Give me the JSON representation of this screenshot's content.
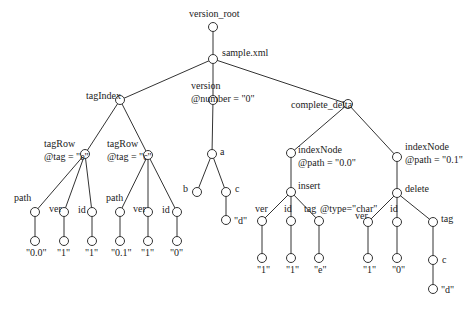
{
  "diagram": {
    "type": "tree",
    "style": {
      "line_color": "#333333",
      "node_fill": "#ffffff",
      "node_stroke": "#333333",
      "node_radius": 4.5
    },
    "nodes": [
      {
        "id": "version_root",
        "x": 213,
        "y": 27,
        "label": "version_root",
        "lx": 189,
        "ly": 8
      },
      {
        "id": "sample_xml",
        "x": 213,
        "y": 59,
        "label": "sample.xml",
        "lx": 222,
        "ly": 47
      },
      {
        "id": "tagIndex",
        "x": 120,
        "y": 100,
        "label": "tagIndex",
        "lx": 86,
        "ly": 90
      },
      {
        "id": "version",
        "x": 213,
        "y": 100,
        "label": "version",
        "label2": "@number = \"0\"",
        "lx": 191,
        "ly": 80
      },
      {
        "id": "complete_delta",
        "x": 348,
        "y": 104,
        "label": "complete_delta",
        "lx": 291,
        "ly": 99
      },
      {
        "id": "tagRow_e",
        "x": 85,
        "y": 154,
        "label": "tagRow",
        "label2": "@tag = \"e\"",
        "lx": 44,
        "ly": 138
      },
      {
        "id": "tagRow_c",
        "x": 148,
        "y": 155,
        "label": "tagRow",
        "label2": "@tag = \"c\"",
        "lx": 107,
        "ly": 138
      },
      {
        "id": "a",
        "x": 212,
        "y": 154,
        "label": "a",
        "lx": 220,
        "ly": 146
      },
      {
        "id": "indexNode_00",
        "x": 291,
        "y": 153,
        "label": "indexNode",
        "label2": "@path = \"0.0\"",
        "lx": 298,
        "ly": 144
      },
      {
        "id": "indexNode_01",
        "x": 397,
        "y": 157,
        "label": "indexNode",
        "label2": "@path = \"0.1\"",
        "lx": 405,
        "ly": 141
      },
      {
        "id": "path1",
        "x": 35,
        "y": 212,
        "label": "path",
        "lx": 14,
        "ly": 192
      },
      {
        "id": "ver1",
        "x": 64,
        "y": 212,
        "label": "ver",
        "lx": 49,
        "ly": 203
      },
      {
        "id": "id1",
        "x": 92,
        "y": 212,
        "label": "id",
        "lx": 78,
        "ly": 204
      },
      {
        "id": "path2",
        "x": 120,
        "y": 212,
        "label": "path",
        "lx": 106,
        "ly": 192
      },
      {
        "id": "ver2",
        "x": 148,
        "y": 212,
        "label": "ver",
        "lx": 133,
        "ly": 203
      },
      {
        "id": "id2",
        "x": 177,
        "y": 212,
        "label": "id",
        "lx": 162,
        "ly": 204
      },
      {
        "id": "b",
        "x": 197,
        "y": 192,
        "label": "b",
        "lx": 183,
        "ly": 183
      },
      {
        "id": "c1",
        "x": 226,
        "y": 192,
        "label": "c",
        "lx": 235,
        "ly": 183
      },
      {
        "id": "insert",
        "x": 291,
        "y": 192,
        "label": "insert",
        "lx": 298,
        "ly": 180
      },
      {
        "id": "delete",
        "x": 397,
        "y": 193,
        "label": "delete",
        "lx": 405,
        "ly": 183
      },
      {
        "id": "v00",
        "x": 35,
        "y": 241,
        "label": "\"0.0\"",
        "lx": 26,
        "ly": 247
      },
      {
        "id": "v1a",
        "x": 64,
        "y": 241,
        "label": "\"1\"",
        "lx": 57,
        "ly": 247
      },
      {
        "id": "v1b",
        "x": 92,
        "y": 241,
        "label": "\"1\"",
        "lx": 85,
        "ly": 247
      },
      {
        "id": "v01",
        "x": 120,
        "y": 241,
        "label": "\"0.1\"",
        "lx": 111,
        "ly": 247
      },
      {
        "id": "v1c",
        "x": 148,
        "y": 241,
        "label": "\"1\"",
        "lx": 141,
        "ly": 247
      },
      {
        "id": "v0a",
        "x": 177,
        "y": 241,
        "label": "\"0\"",
        "lx": 170,
        "ly": 247
      },
      {
        "id": "d1",
        "x": 226,
        "y": 220,
        "label": "\"d\"",
        "lx": 234,
        "ly": 215
      },
      {
        "id": "ver3",
        "x": 262,
        "y": 221,
        "label": "ver",
        "lx": 255,
        "ly": 203
      },
      {
        "id": "id3",
        "x": 291,
        "y": 221,
        "label": "id",
        "lx": 284,
        "ly": 203
      },
      {
        "id": "tag3",
        "x": 319,
        "y": 221,
        "label": "tag",
        "lx": 304,
        "ly": 203
      },
      {
        "id": "ver4",
        "x": 368,
        "y": 222,
        "label": "ver",
        "lx": 355,
        "ly": 210
      },
      {
        "id": "id4",
        "x": 397,
        "y": 222,
        "label": "id",
        "lx": 390,
        "ly": 203
      },
      {
        "id": "tag4",
        "x": 433,
        "y": 222,
        "label": "tag",
        "lx": 441,
        "ly": 213
      },
      {
        "id": "v1d",
        "x": 262,
        "y": 258,
        "label": "\"1\"",
        "lx": 257,
        "ly": 264
      },
      {
        "id": "v1e",
        "x": 291,
        "y": 258,
        "label": "\"1\"",
        "lx": 286,
        "ly": 264
      },
      {
        "id": "ve",
        "x": 319,
        "y": 258,
        "label": "\"e\"",
        "lx": 314,
        "ly": 264
      },
      {
        "id": "v1f",
        "x": 368,
        "y": 258,
        "label": "\"1\"",
        "lx": 363,
        "ly": 264
      },
      {
        "id": "v0b",
        "x": 397,
        "y": 258,
        "label": "\"0\"",
        "lx": 392,
        "ly": 264
      },
      {
        "id": "c2",
        "x": 433,
        "y": 260,
        "label": "c",
        "lx": 442,
        "ly": 254
      },
      {
        "id": "d2",
        "x": 433,
        "y": 289,
        "label": "\"d\"",
        "lx": 441,
        "ly": 284
      }
    ],
    "annotations": [
      {
        "id": "type_char",
        "text": "@type=\"char\"",
        "x": 320,
        "y": 203
      }
    ],
    "edges": [
      [
        "version_root",
        "sample_xml"
      ],
      [
        "sample_xml",
        "tagIndex"
      ],
      [
        "sample_xml",
        "version"
      ],
      [
        "sample_xml",
        "complete_delta"
      ],
      [
        "tagIndex",
        "tagRow_e"
      ],
      [
        "tagIndex",
        "tagRow_c"
      ],
      [
        "tagRow_e",
        "path1"
      ],
      [
        "tagRow_e",
        "ver1"
      ],
      [
        "tagRow_e",
        "id1"
      ],
      [
        "tagRow_c",
        "path2"
      ],
      [
        "tagRow_c",
        "ver2"
      ],
      [
        "tagRow_c",
        "id2"
      ],
      [
        "path1",
        "v00"
      ],
      [
        "ver1",
        "v1a"
      ],
      [
        "id1",
        "v1b"
      ],
      [
        "path2",
        "v01"
      ],
      [
        "ver2",
        "v1c"
      ],
      [
        "id2",
        "v0a"
      ],
      [
        "version",
        "a"
      ],
      [
        "a",
        "b"
      ],
      [
        "a",
        "c1"
      ],
      [
        "c1",
        "d1"
      ],
      [
        "complete_delta",
        "indexNode_00"
      ],
      [
        "complete_delta",
        "indexNode_01"
      ],
      [
        "indexNode_00",
        "insert"
      ],
      [
        "insert",
        "ver3"
      ],
      [
        "insert",
        "id3"
      ],
      [
        "insert",
        "tag3"
      ],
      [
        "ver3",
        "v1d"
      ],
      [
        "id3",
        "v1e"
      ],
      [
        "tag3",
        "ve"
      ],
      [
        "indexNode_01",
        "delete"
      ],
      [
        "delete",
        "ver4"
      ],
      [
        "delete",
        "id4"
      ],
      [
        "delete",
        "tag4"
      ],
      [
        "ver4",
        "v1f"
      ],
      [
        "id4",
        "v0b"
      ],
      [
        "tag4",
        "c2"
      ],
      [
        "c2",
        "d2"
      ]
    ]
  }
}
